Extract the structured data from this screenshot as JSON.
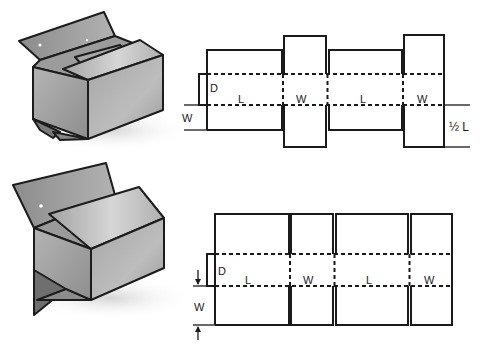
{
  "diagrams": [
    {
      "id": "top",
      "style": "regular slotted carton with half-length bottom flaps",
      "labels": {
        "depth": "D",
        "panel1": "L",
        "panel2": "W",
        "panel3": "L",
        "panel4": "W",
        "flap_dimension_left": "W",
        "flap_dimension_right": "½ L"
      }
    },
    {
      "id": "bottom",
      "style": "full overlap carton with full-width flaps",
      "labels": {
        "depth": "D",
        "panel1": "L",
        "panel2": "W",
        "panel3": "L",
        "panel4": "W",
        "flap_dimension_left": "W"
      }
    }
  ],
  "colors": {
    "line": "#1a1a1a",
    "box_face_light": "#c8c8c8",
    "box_face_mid": "#a9a9a9",
    "box_face_dark": "#7d7d7d",
    "shadow": "#e2e2e2"
  }
}
